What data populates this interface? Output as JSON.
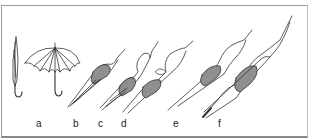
{
  "figure": {
    "labels": [
      "a",
      "b",
      "c",
      "d",
      "e",
      "f"
    ],
    "colors": {
      "line": "#333333",
      "nucleus": "#8f8f8f",
      "border": "#9a9a9a"
    }
  }
}
